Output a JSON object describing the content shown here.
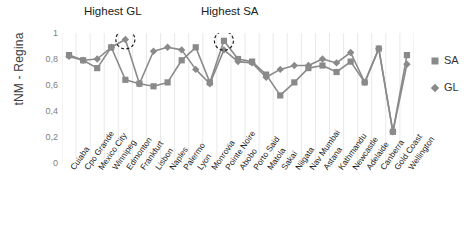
{
  "chart_data": {
    "type": "line",
    "title": "",
    "xlabel": "",
    "ylabel": "tNM - Regina",
    "ylim": [
      0,
      1
    ],
    "yticks": [
      "0",
      "0,2",
      "0,4",
      "0,6",
      "0,8",
      "1"
    ],
    "ytick_values": [
      0,
      0.2,
      0.4,
      0.6,
      0.8,
      1
    ],
    "grid": "vertical",
    "legend_position": "right",
    "categories": [
      "Cuiaba",
      "Cpo Grande",
      "Mexico City",
      "Winnipeg",
      "Edmonton",
      "Frankfurt",
      "Lisbon",
      "Naples",
      "Palermo",
      "Lyon",
      "Monrovia",
      "Pointe Noire",
      "Abobo",
      "Porto Said",
      "Matola",
      "Sakai",
      "Niigata",
      "Nav Mumbai",
      "Astana",
      "Kathmandu",
      "Newcastle",
      "Adelaide",
      "Canberra",
      "Gold Coast",
      "Wellington"
    ],
    "series": [
      {
        "name": "SA",
        "marker": "square",
        "color": "#8a8a8a",
        "values": [
          0.83,
          0.79,
          0.73,
          0.89,
          0.64,
          0.61,
          0.59,
          0.62,
          0.79,
          0.89,
          0.62,
          0.94,
          0.8,
          0.78,
          0.68,
          0.52,
          0.62,
          0.73,
          0.75,
          0.7,
          0.78,
          0.62,
          0.88,
          0.24,
          0.83
        ]
      },
      {
        "name": "GL",
        "marker": "diamond",
        "color": "#8a8a8a",
        "values": [
          0.82,
          0.79,
          0.8,
          0.89,
          0.95,
          0.61,
          0.86,
          0.89,
          0.87,
          0.72,
          0.61,
          0.87,
          0.78,
          0.77,
          0.66,
          0.72,
          0.75,
          0.75,
          0.8,
          0.77,
          0.85,
          0.62,
          0.88,
          0.24,
          0.76
        ]
      }
    ],
    "annotations": [
      {
        "label": "Highest GL",
        "target_category": "Edmonton",
        "target_value": 0.95
      },
      {
        "label": "Highest SA",
        "target_category": "Pointe Noire",
        "target_value": 0.94
      }
    ],
    "legend": [
      {
        "label": "SA",
        "marker": "square"
      },
      {
        "label": "GL",
        "marker": "diamond"
      }
    ]
  }
}
